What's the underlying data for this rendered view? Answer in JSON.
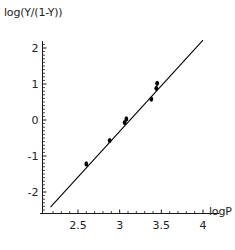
{
  "chart_data": {
    "type": "scatter",
    "title": "",
    "subtitle": "",
    "xlabel": "logP",
    "ylabel": "log(Y/(1-Y))",
    "xlim": [
      2.14,
      4.12
    ],
    "ylim": [
      -2.62,
      2.38
    ],
    "grid": false,
    "legend": null,
    "x_ticks": [
      {
        "value": 2.5,
        "label": "2.5"
      },
      {
        "value": 3,
        "label": "3"
      },
      {
        "value": 3.5,
        "label": "3.5"
      },
      {
        "value": 4,
        "label": "4"
      }
    ],
    "y_ticks": [
      {
        "value": 2,
        "label": "2"
      },
      {
        "value": 1,
        "label": "1"
      },
      {
        "value": 0,
        "label": "0"
      },
      {
        "value": -1,
        "label": "-1"
      },
      {
        "value": -2,
        "label": "-2"
      }
    ],
    "x_minor_tick_step": 0.1,
    "y_minor_tick_step": 0.1,
    "series": [
      {
        "name": "data points",
        "type": "scatter",
        "marker": "filled-circle",
        "color": "#000000",
        "points": [
          {
            "x": 2.6,
            "y": -1.22
          },
          {
            "x": 2.88,
            "y": -0.57
          },
          {
            "x": 3.06,
            "y": -0.07
          },
          {
            "x": 3.08,
            "y": 0.03
          },
          {
            "x": 3.38,
            "y": 0.58
          },
          {
            "x": 3.44,
            "y": 0.88
          },
          {
            "x": 3.45,
            "y": 1.02
          }
        ]
      },
      {
        "name": "regression line",
        "type": "line",
        "color": "#000000",
        "endpoints": [
          {
            "x": 2.17,
            "y": -2.42
          },
          {
            "x": 4.0,
            "y": 2.22
          }
        ]
      }
    ]
  },
  "axes": {
    "x_axis_label": "logP",
    "y_axis_label": "log(Y/(1-Y))"
  }
}
